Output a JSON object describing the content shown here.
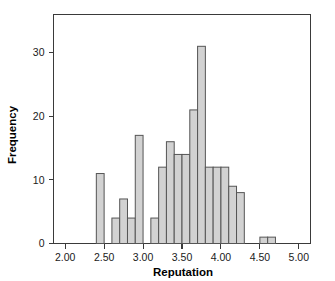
{
  "chart_data": {
    "type": "bar",
    "title": "",
    "subtitle": "",
    "xlabel": "Reputation",
    "ylabel": "Frequency",
    "xlim": [
      1.85,
      5.15
    ],
    "ylim": [
      0,
      36
    ],
    "grid": false,
    "legend": null,
    "bin_width": 0.1,
    "x_ticks": [
      "2.00",
      "2.50",
      "3.00",
      "3.50",
      "4.00",
      "4.50",
      "5.00"
    ],
    "x_tick_values": [
      2.0,
      2.5,
      3.0,
      3.5,
      4.0,
      4.5,
      5.0
    ],
    "y_ticks": [
      "0",
      "10",
      "20",
      "30"
    ],
    "y_tick_values": [
      0,
      10,
      20,
      30
    ],
    "bins": [
      {
        "left": 2.4,
        "right": 2.5,
        "value": 11
      },
      {
        "left": 2.5,
        "right": 2.6,
        "value": 0
      },
      {
        "left": 2.6,
        "right": 2.7,
        "value": 4
      },
      {
        "left": 2.7,
        "right": 2.8,
        "value": 7
      },
      {
        "left": 2.8,
        "right": 2.9,
        "value": 4
      },
      {
        "left": 2.9,
        "right": 3.0,
        "value": 17
      },
      {
        "left": 3.0,
        "right": 3.1,
        "value": 0
      },
      {
        "left": 3.1,
        "right": 3.2,
        "value": 4
      },
      {
        "left": 3.2,
        "right": 3.3,
        "value": 12
      },
      {
        "left": 3.3,
        "right": 3.4,
        "value": 16
      },
      {
        "left": 3.4,
        "right": 3.5,
        "value": 14
      },
      {
        "left": 3.5,
        "right": 3.6,
        "value": 14
      },
      {
        "left": 3.6,
        "right": 3.7,
        "value": 21
      },
      {
        "left": 3.7,
        "right": 3.8,
        "value": 31
      },
      {
        "left": 3.8,
        "right": 3.9,
        "value": 12
      },
      {
        "left": 3.9,
        "right": 4.0,
        "value": 12
      },
      {
        "left": 4.0,
        "right": 4.1,
        "value": 12
      },
      {
        "left": 4.1,
        "right": 4.2,
        "value": 9
      },
      {
        "left": 4.2,
        "right": 4.3,
        "value": 8
      },
      {
        "left": 4.5,
        "right": 4.6,
        "value": 1
      },
      {
        "left": 4.6,
        "right": 4.7,
        "value": 1
      }
    ],
    "colors": {
      "bar_fill": "#d2d2d2",
      "bar_stroke": "#555555",
      "axis": "#3a3a3a",
      "text": "#1a1a1a",
      "background": "#ffffff"
    }
  }
}
